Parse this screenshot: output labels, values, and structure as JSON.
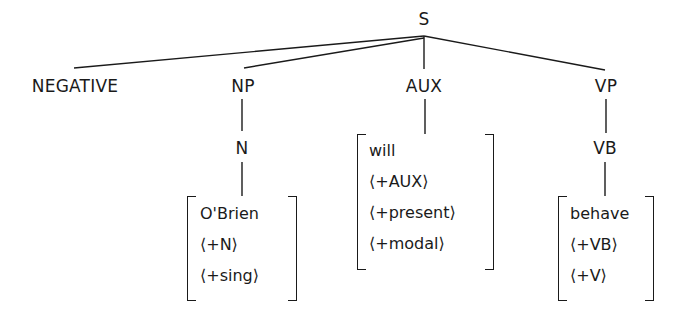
{
  "tree": {
    "root": {
      "label": "S"
    },
    "children": [
      {
        "label": "NEGATIVE"
      },
      {
        "label": "NP",
        "child": {
          "label": "N",
          "features": [
            "O'Brien",
            "⟨+N⟩",
            "⟨+sing⟩"
          ]
        }
      },
      {
        "label": "AUX",
        "features": [
          "will",
          "⟨+AUX⟩",
          "⟨+present⟩",
          "⟨+modal⟩"
        ]
      },
      {
        "label": "VP",
        "child": {
          "label": "VB",
          "features": [
            "behave",
            "⟨+VB⟩",
            "⟨+V⟩"
          ]
        }
      }
    ]
  },
  "colors": {
    "ink": "#1a1a1a",
    "background": "#ffffff"
  }
}
